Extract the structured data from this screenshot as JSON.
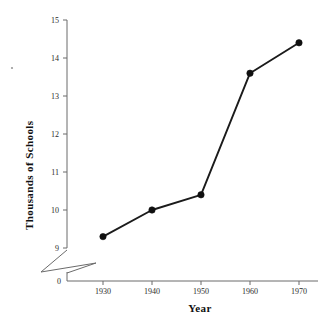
{
  "chart_data": {
    "type": "line",
    "title": "",
    "xlabel": "Year",
    "ylabel": "Thousands of Schools",
    "x": [
      1930,
      1940,
      1950,
      1960,
      1970
    ],
    "values": [
      9.3,
      10.0,
      10.4,
      13.6,
      14.4
    ],
    "xtick_labels": [
      "1930",
      "1940",
      "1950",
      "1960",
      "1970"
    ],
    "ytick_labels": [
      "0",
      "9",
      "10",
      "11",
      "12",
      "13",
      "14",
      "15"
    ],
    "ylim": [
      9,
      15
    ],
    "xlim": [
      1925,
      1975
    ],
    "grid": false,
    "legend": null,
    "axis_break": true,
    "axis_break_note": "zigzag break on y-axis between 0 and 9",
    "marker": "filled-circle",
    "line_color": "#1b1b1b",
    "marker_color": "#101010",
    "background_color": "#ffffff"
  },
  "axes": {
    "y_title": "Thousands of Schools",
    "x_title": "Year",
    "y_ticks": [
      {
        "label": "15",
        "value": 15
      },
      {
        "label": "14",
        "value": 14
      },
      {
        "label": "13",
        "value": 13
      },
      {
        "label": "12",
        "value": 12
      },
      {
        "label": "11",
        "value": 11
      },
      {
        "label": "10",
        "value": 10
      },
      {
        "label": "9",
        "value": 9
      },
      {
        "label": "0",
        "value": 0
      }
    ],
    "x_ticks": [
      {
        "label": "1930",
        "value": 1930
      },
      {
        "label": "1940",
        "value": 1940
      },
      {
        "label": "1950",
        "value": 1950
      },
      {
        "label": "1960",
        "value": 1960
      },
      {
        "label": "1970",
        "value": 1970
      }
    ]
  }
}
